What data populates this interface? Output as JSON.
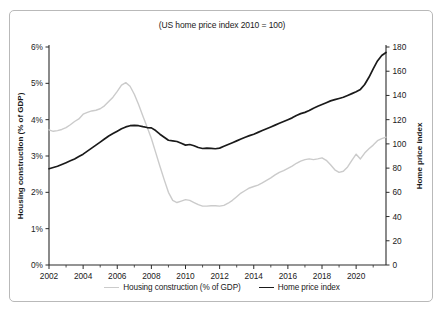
{
  "chart_data": {
    "type": "line",
    "title": "(US home price index 2010 = 100)",
    "xlabel": "",
    "ylabel": "Housing construction (% of GDP)",
    "y2label": "Home price index",
    "grid": false,
    "legend_position": "bottom-center",
    "xlim": [
      2002,
      2021.75
    ],
    "ylim": [
      0,
      6
    ],
    "y2lim": [
      0,
      180
    ],
    "x_ticks": [
      2002,
      2004,
      2006,
      2008,
      2010,
      2012,
      2014,
      2016,
      2018,
      2020
    ],
    "x_tick_labels": [
      "2002",
      "2004",
      "2006",
      "2008",
      "2010",
      "2012",
      "2014",
      "2016",
      "2018",
      "2020"
    ],
    "x_minor_tick_step": 1,
    "y_ticks": [
      0,
      1,
      2,
      3,
      4,
      5,
      6
    ],
    "y_tick_labels": [
      "0%",
      "1%",
      "2%",
      "3%",
      "4%",
      "5%",
      "6%"
    ],
    "y2_ticks": [
      0,
      20,
      40,
      60,
      80,
      100,
      120,
      140,
      160,
      180
    ],
    "y2_tick_labels": [
      "0",
      "20",
      "40",
      "60",
      "80",
      "100",
      "120",
      "140",
      "160",
      "180"
    ],
    "series": [
      {
        "name": "Housing construction (% of GDP)",
        "axis": "left",
        "color": "#cbcbcb",
        "width": 1.4,
        "x": [
          2002.0,
          2002.25,
          2002.5,
          2002.75,
          2003.0,
          2003.25,
          2003.5,
          2003.75,
          2004.0,
          2004.25,
          2004.5,
          2004.75,
          2005.0,
          2005.25,
          2005.5,
          2005.75,
          2006.0,
          2006.25,
          2006.5,
          2006.75,
          2007.0,
          2007.25,
          2007.5,
          2007.75,
          2008.0,
          2008.25,
          2008.5,
          2008.75,
          2009.0,
          2009.25,
          2009.5,
          2009.75,
          2010.0,
          2010.25,
          2010.5,
          2010.75,
          2011.0,
          2011.25,
          2011.5,
          2011.75,
          2012.0,
          2012.25,
          2012.5,
          2012.75,
          2013.0,
          2013.25,
          2013.5,
          2013.75,
          2014.0,
          2014.25,
          2014.5,
          2014.75,
          2015.0,
          2015.25,
          2015.5,
          2015.75,
          2016.0,
          2016.25,
          2016.5,
          2016.75,
          2017.0,
          2017.25,
          2017.5,
          2017.75,
          2018.0,
          2018.25,
          2018.5,
          2018.75,
          2019.0,
          2019.25,
          2019.5,
          2019.75,
          2020.0,
          2020.25,
          2020.5,
          2020.75,
          2021.0,
          2021.25,
          2021.5,
          2021.75
        ],
        "values": [
          3.72,
          3.68,
          3.7,
          3.73,
          3.78,
          3.86,
          3.95,
          4.02,
          4.15,
          4.2,
          4.24,
          4.26,
          4.3,
          4.38,
          4.5,
          4.62,
          4.78,
          4.95,
          5.02,
          4.92,
          4.7,
          4.42,
          4.1,
          3.8,
          3.48,
          3.1,
          2.72,
          2.35,
          2.0,
          1.78,
          1.72,
          1.76,
          1.8,
          1.78,
          1.72,
          1.66,
          1.62,
          1.62,
          1.63,
          1.63,
          1.62,
          1.64,
          1.7,
          1.78,
          1.88,
          1.98,
          2.05,
          2.12,
          2.16,
          2.2,
          2.26,
          2.33,
          2.4,
          2.48,
          2.55,
          2.6,
          2.66,
          2.72,
          2.8,
          2.86,
          2.9,
          2.92,
          2.9,
          2.92,
          2.95,
          2.88,
          2.76,
          2.62,
          2.55,
          2.58,
          2.7,
          2.88,
          3.05,
          2.92,
          3.08,
          3.2,
          3.3,
          3.42,
          3.48,
          3.52
        ]
      },
      {
        "name": "Home price index",
        "axis": "right",
        "color": "#1a1a1a",
        "width": 1.7,
        "x": [
          2002.0,
          2002.25,
          2002.5,
          2002.75,
          2003.0,
          2003.25,
          2003.5,
          2003.75,
          2004.0,
          2004.25,
          2004.5,
          2004.75,
          2005.0,
          2005.25,
          2005.5,
          2005.75,
          2006.0,
          2006.25,
          2006.5,
          2006.75,
          2007.0,
          2007.25,
          2007.5,
          2007.75,
          2008.0,
          2008.25,
          2008.5,
          2008.75,
          2009.0,
          2009.25,
          2009.5,
          2009.75,
          2010.0,
          2010.25,
          2010.5,
          2010.75,
          2011.0,
          2011.25,
          2011.5,
          2011.75,
          2012.0,
          2012.25,
          2012.5,
          2012.75,
          2013.0,
          2013.25,
          2013.5,
          2013.75,
          2014.0,
          2014.25,
          2014.5,
          2014.75,
          2015.0,
          2015.25,
          2015.5,
          2015.75,
          2016.0,
          2016.25,
          2016.5,
          2016.75,
          2017.0,
          2017.25,
          2017.5,
          2017.75,
          2018.0,
          2018.25,
          2018.5,
          2018.75,
          2019.0,
          2019.25,
          2019.5,
          2019.75,
          2020.0,
          2020.25,
          2020.5,
          2020.75,
          2021.0,
          2021.25,
          2021.5,
          2021.75
        ],
        "values": [
          79.5,
          80.5,
          81.5,
          83.0,
          84.5,
          86.0,
          87.5,
          89.5,
          91.5,
          94.0,
          96.5,
          99.0,
          101.5,
          104.0,
          106.5,
          108.5,
          110.5,
          112.5,
          114.0,
          115.0,
          115.3,
          115.0,
          114.2,
          113.5,
          113.2,
          111.0,
          108.0,
          105.5,
          103.0,
          102.5,
          102.0,
          100.5,
          99.0,
          99.5,
          98.5,
          97.0,
          96.2,
          96.5,
          96.3,
          96.0,
          96.5,
          98.0,
          99.5,
          101.0,
          102.5,
          104.0,
          105.5,
          106.8,
          108.0,
          109.5,
          111.0,
          112.5,
          114.0,
          115.5,
          117.0,
          118.5,
          120.0,
          121.5,
          123.5,
          125.0,
          126.0,
          127.5,
          129.5,
          131.0,
          132.5,
          134.0,
          135.5,
          136.5,
          137.5,
          138.5,
          140.0,
          141.5,
          143.0,
          145.0,
          149.0,
          155.0,
          162.0,
          168.5,
          173.0,
          175.5
        ]
      }
    ]
  },
  "legend": {
    "items": [
      {
        "label": "Housing construction (% of GDP)",
        "color": "#cbcbcb"
      },
      {
        "label": "Home price index",
        "color": "#1a1a1a"
      }
    ]
  }
}
